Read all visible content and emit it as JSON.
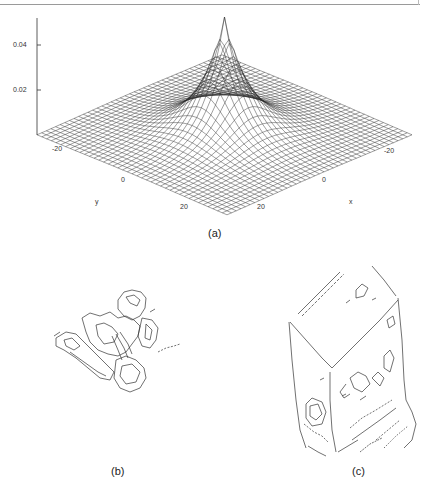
{
  "figure": {
    "panels": [
      {
        "id": "a",
        "label": "(a)",
        "kind": "3d-surface-mesh"
      },
      {
        "id": "b",
        "label": "(b)",
        "kind": "edge-map"
      },
      {
        "id": "c",
        "label": "(c)",
        "kind": "edge-map"
      }
    ],
    "panel_a": {
      "z_ticks": [
        "0.04",
        "0.02"
      ],
      "y_axis": {
        "label": "y",
        "ticks": [
          "-20",
          "0",
          "20"
        ]
      },
      "x_axis": {
        "label": "x",
        "ticks": [
          "-20",
          "0",
          "20"
        ]
      }
    }
  },
  "chart_data": {
    "type": "surface",
    "title": "",
    "xlabel": "x",
    "ylabel": "y",
    "zlabel": "",
    "x_ticks": [
      -20,
      0,
      20
    ],
    "y_ticks": [
      -20,
      0,
      20
    ],
    "z_ticks": [
      0.02,
      0.04
    ],
    "x_range": [
      -30,
      30
    ],
    "y_range": [
      -30,
      30
    ],
    "z_range": [
      0,
      0.05
    ],
    "peak": {
      "x": 0,
      "y": 0,
      "z": 0.05
    },
    "grid": false
  }
}
